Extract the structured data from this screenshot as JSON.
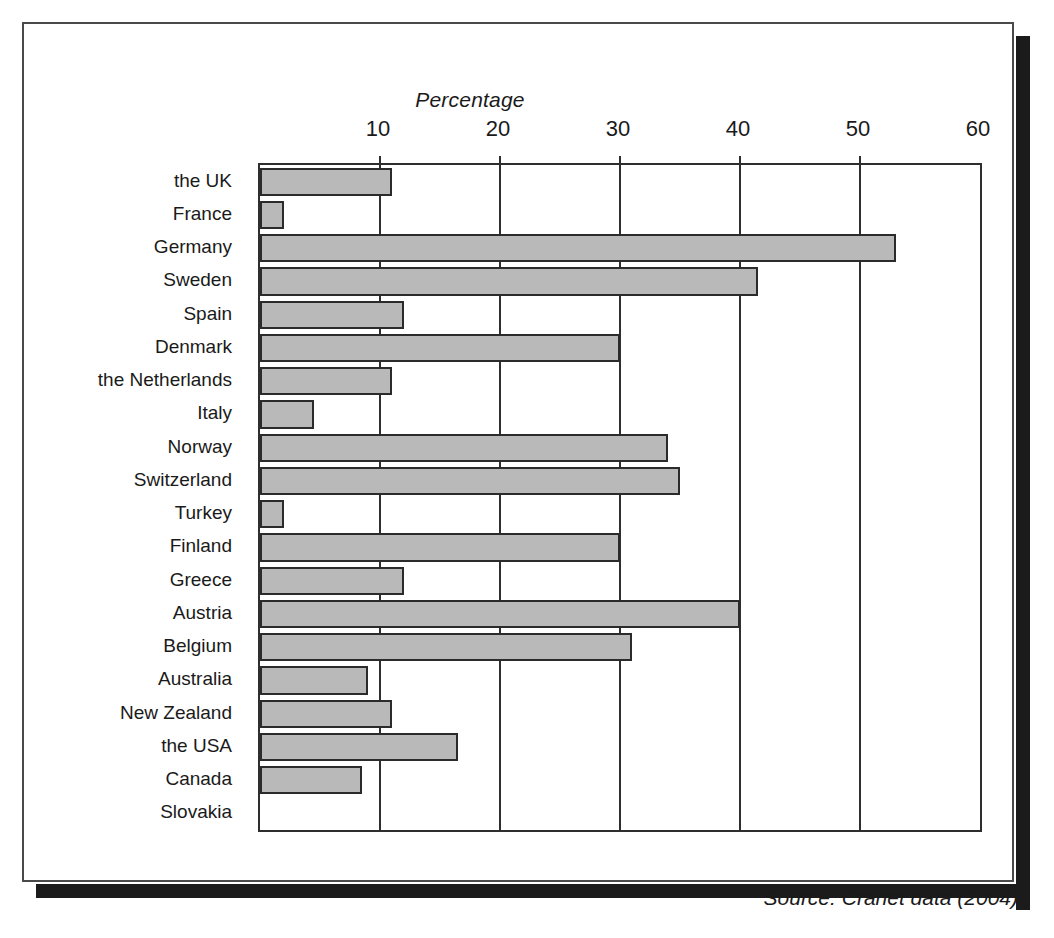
{
  "figure": {
    "source_note": "Source: Cranet data (2004)"
  },
  "chart_data": {
    "type": "bar",
    "orientation": "horizontal",
    "title": "Percentage",
    "xlabel": "Percentage",
    "ylabel": "",
    "xlim": [
      0,
      60
    ],
    "xticks": [
      10,
      20,
      30,
      40,
      50,
      60
    ],
    "xtick_labels": [
      "10",
      "20",
      "30",
      "40",
      "50",
      "60"
    ],
    "grid": true,
    "legend": false,
    "bar_color": "#b9b9b9",
    "bar_border_color": "#2b2b2b",
    "categories": [
      "the UK",
      "France",
      "Germany",
      "Sweden",
      "Spain",
      "Denmark",
      "the Netherlands",
      "Italy",
      "Norway",
      "Switzerland",
      "Turkey",
      "Finland",
      "Greece",
      "Austria",
      "Belgium",
      "Australia",
      "New Zealand",
      "the USA",
      "Canada",
      "Slovakia"
    ],
    "values": [
      11,
      2,
      53,
      41.5,
      12,
      30,
      11,
      4.5,
      34,
      35,
      2,
      30,
      12,
      40,
      31,
      9,
      11,
      16.5,
      8.5,
      0
    ]
  }
}
